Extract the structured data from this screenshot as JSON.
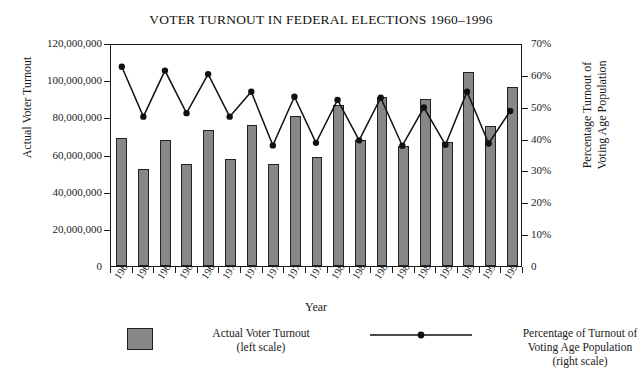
{
  "chart_data": {
    "type": "bar",
    "title": "VOTER TURNOUT IN FEDERAL ELECTIONS 1960–1996",
    "xlabel": "Year",
    "ylabel": "Actual Voter Turnout",
    "ylabel_right_line1": "Percentage Turnout of",
    "ylabel_right_line2": "Voting Age Population",
    "categories": [
      "1960",
      "1962",
      "1964",
      "1966",
      "1968",
      "1970",
      "1972",
      "1974",
      "1976",
      "1978",
      "1980",
      "1982",
      "1984",
      "1986",
      "1988",
      "1990",
      "1992",
      "1994",
      "1996"
    ],
    "ylim": [
      0,
      120000000
    ],
    "ylim_right": [
      0,
      70
    ],
    "yticks": [
      0,
      20000000,
      40000000,
      60000000,
      80000000,
      100000000,
      120000000
    ],
    "ytick_labels": [
      "0",
      "20,000,000",
      "40,000,000",
      "60,000,000",
      "80,000,000",
      "100,000,000",
      "120,000,000"
    ],
    "yticks_right": [
      0,
      10,
      20,
      30,
      40,
      50,
      60,
      70
    ],
    "ytick_labels_right": [
      "0",
      "10%",
      "20%",
      "30%",
      "40%",
      "50%",
      "60%",
      "70%"
    ],
    "grid": false,
    "legend_position": "bottom",
    "series": [
      {
        "name": "Actual Voter Turnout",
        "sub": "(left scale)",
        "type": "bar",
        "axis": "left",
        "color": "#878787",
        "values": [
          68838204,
          52000000,
          68000000,
          55000000,
          73000000,
          57500000,
          76000000,
          55000000,
          80500000,
          58900000,
          86500000,
          67600000,
          91000000,
          64500000,
          90000000,
          66800000,
          104400000,
          75100000,
          96300000
        ]
      },
      {
        "name": "Percentage of Turnout of Voting Age Population",
        "sub": "(right scale)",
        "type": "line",
        "axis": "right",
        "color": "#111111",
        "marker": "circle",
        "values": [
          63.1,
          47.3,
          61.9,
          48.4,
          60.8,
          47.3,
          55.2,
          38.2,
          53.6,
          39.0,
          52.6,
          39.8,
          53.3,
          38.1,
          50.2,
          38.4,
          55.2,
          38.8,
          49.1
        ]
      }
    ]
  },
  "legend": {
    "bar_label": "Actual Voter Turnout",
    "bar_sub": "(left scale)",
    "line_label_line1": "Percentage of Turnout of",
    "line_label_line2": "Voting Age Population",
    "line_sub": "(right scale)"
  },
  "colors": {
    "bar_fill": "#878787",
    "bar_stroke": "#222222",
    "line": "#111111",
    "axis": "#1a1a1a",
    "background": "#ffffff"
  }
}
